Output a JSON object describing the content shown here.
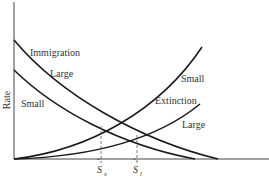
{
  "diagram": {
    "ylabel": "Rate",
    "labels": {
      "immigration": "Immigration",
      "immigration_large": "Large",
      "immigration_small": "Small",
      "extinction": "Extinction",
      "extinction_small": "Small",
      "extinction_large": "Large"
    },
    "equilibria": {
      "small": {
        "symbol": "S",
        "subscript": "s",
        "x": 101
      },
      "large": {
        "symbol": "S",
        "subscript": "l",
        "x": 137
      }
    },
    "curves": [
      {
        "name": "immigration-large",
        "type": "immigration",
        "size": "Large"
      },
      {
        "name": "immigration-small",
        "type": "immigration",
        "size": "Small"
      },
      {
        "name": "extinction-small",
        "type": "extinction",
        "size": "Small"
      },
      {
        "name": "extinction-large",
        "type": "extinction",
        "size": "Large"
      }
    ],
    "line_color": "#1a1a1a",
    "dash_color": "#555555"
  }
}
